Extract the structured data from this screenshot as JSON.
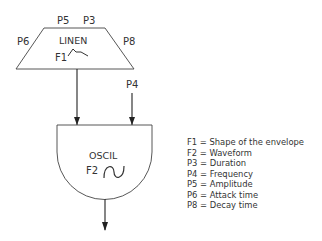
{
  "diagram": {
    "linen": {
      "name": "LINEN",
      "function_label": "F1",
      "inputs": {
        "top_left": "P5",
        "top_right": "P3",
        "left": "P6",
        "right": "P8"
      }
    },
    "oscil": {
      "name": "OSCIL",
      "function_label": "F2",
      "frequency_input": "P4"
    }
  },
  "legend": {
    "items": [
      "F1 = Shape of the envelope",
      "F2 = Waveform",
      "P3 = Duration",
      "P4 = Frequency",
      "P5 = Amplitude",
      "P6 = Attack time",
      "P8 = Decay time"
    ]
  },
  "colors": {
    "stroke": "#333333",
    "background": "#ffffff"
  }
}
